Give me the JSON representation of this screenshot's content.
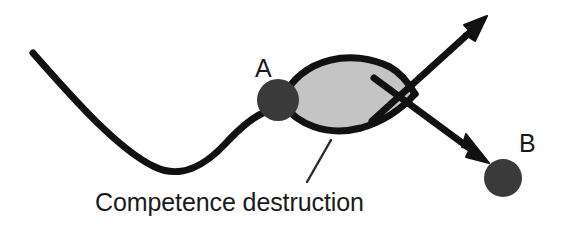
{
  "figure": {
    "type": "conceptual-diagram",
    "title_text": "",
    "background_color": "#ffffff"
  },
  "colors": {
    "stroke": "#111111",
    "node_fill": "#3a3a3a",
    "lens_fill": "#c4c4c4",
    "text": "#1a1a1a",
    "leader_line": "#2b2b2b"
  },
  "nodes": [
    {
      "id": "A",
      "label": "A",
      "label_x": 255,
      "label_y": 77,
      "cx": 278,
      "cy": 100,
      "r": 21,
      "icon": "filled-circle-node"
    },
    {
      "id": "B",
      "label": "B",
      "label_x": 519,
      "label_y": 152,
      "cx": 503,
      "cy": 178,
      "r": 19,
      "icon": "filled-circle-node"
    }
  ],
  "lens": {
    "name": "competence-destruction-lens",
    "fill": "#c4c4c4",
    "left_x": 285,
    "right_x": 414,
    "top_y": 60,
    "bottom_y": 129
  },
  "caption": {
    "text": "Competence destruction",
    "x": 95,
    "y": 211,
    "font_size": 25
  },
  "leader_line": {
    "name": "caption-leader-line",
    "x1": 331,
    "y1": 140,
    "x2": 307,
    "y2": 182
  },
  "paths": {
    "landscape_curve": {
      "name": "potential-landscape-curve",
      "start": [
        33,
        53
      ],
      "valley": [
        178,
        172
      ],
      "end": [
        262,
        114
      ],
      "stroke_width": 7
    },
    "arrow_up_right": {
      "name": "arrow-up-right",
      "start": [
        372,
        121
      ],
      "tip": [
        487,
        16
      ],
      "stroke_width": 7
    },
    "arrow_down_right": {
      "name": "arrow-down-right",
      "start": [
        374,
        78
      ],
      "tip": [
        489,
        163
      ],
      "stroke_width": 7
    }
  }
}
